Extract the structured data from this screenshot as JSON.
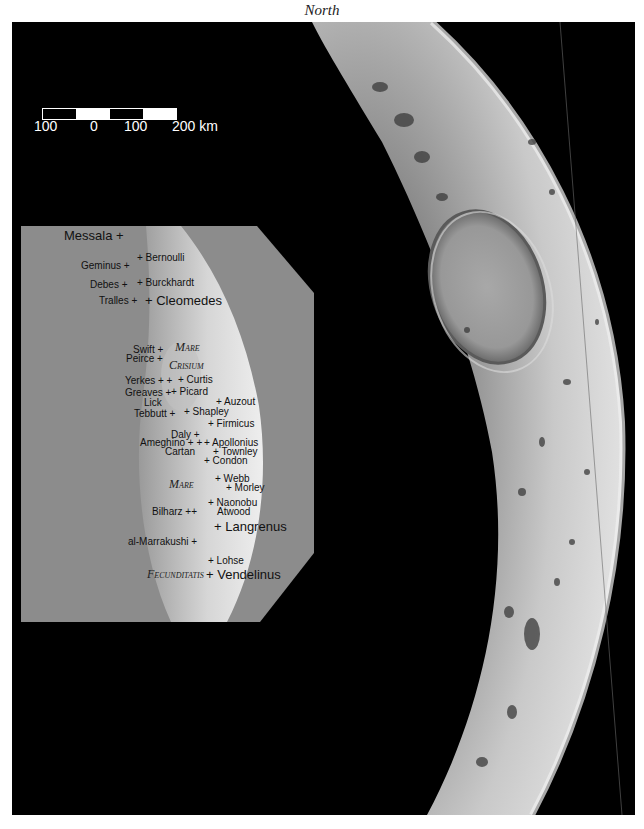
{
  "title": "North",
  "corner_text": "",
  "scale_bar": {
    "labels": [
      "100",
      "0",
      "100",
      "200 km"
    ],
    "segments": [
      "black",
      "white",
      "black",
      "white"
    ]
  },
  "inset": {
    "maria": [
      {
        "id": "mare-crisium-1",
        "text": "Mare"
      },
      {
        "id": "mare-crisium-2",
        "text": "Crisium"
      },
      {
        "id": "mare-fecunditatis-1",
        "text": "Mare"
      },
      {
        "id": "mare-fecunditatis-2",
        "text": "Fecunditatis"
      }
    ],
    "craters": [
      {
        "id": "messala",
        "text": "Messala +"
      },
      {
        "id": "bernoulli",
        "text": "+ Bernoulli"
      },
      {
        "id": "geminus",
        "text": "Geminus +"
      },
      {
        "id": "debes",
        "text": "Debes +"
      },
      {
        "id": "burckhardt",
        "text": "+ Burckhardt"
      },
      {
        "id": "tralles",
        "text": "Tralles +"
      },
      {
        "id": "cleomedes",
        "text": "+ Cleomedes"
      },
      {
        "id": "swift",
        "text": "Swift +"
      },
      {
        "id": "peirce",
        "text": "Peirce +"
      },
      {
        "id": "yerkes",
        "text": "Yerkes + +"
      },
      {
        "id": "curtis",
        "text": "+ Curtis"
      },
      {
        "id": "greaves",
        "text": "Greaves +"
      },
      {
        "id": "picard",
        "text": "+ Picard"
      },
      {
        "id": "lick",
        "text": "Lick"
      },
      {
        "id": "auzout",
        "text": "+ Auzout"
      },
      {
        "id": "tebbutt",
        "text": "Tebbutt +"
      },
      {
        "id": "shapley",
        "text": "+ Shapley"
      },
      {
        "id": "firmicus",
        "text": "+ Firmicus"
      },
      {
        "id": "daly",
        "text": "Daly +"
      },
      {
        "id": "ameghino",
        "text": "Ameghino + +"
      },
      {
        "id": "apollonius",
        "text": "+ Apollonius"
      },
      {
        "id": "cartan",
        "text": "Cartan"
      },
      {
        "id": "townley",
        "text": "+ Townley"
      },
      {
        "id": "condon",
        "text": "+ Condon"
      },
      {
        "id": "webb",
        "text": "+ Webb"
      },
      {
        "id": "morley",
        "text": "+ Morley"
      },
      {
        "id": "naonobu",
        "text": "+ Naonobu"
      },
      {
        "id": "bilharz",
        "text": "Bilharz ++"
      },
      {
        "id": "atwood",
        "text": "Atwood"
      },
      {
        "id": "langrenus",
        "text": "+ Langrenus"
      },
      {
        "id": "al-marrakushi",
        "text": "al-Marrakushi +"
      },
      {
        "id": "lohse",
        "text": "+ Lohse"
      },
      {
        "id": "vendelinus",
        "text": "+ Vendelinus"
      }
    ]
  },
  "colors": {
    "background": "#ffffff",
    "sky": "#000000",
    "inset_background": "#8c8c8c",
    "moon_surface": "#c8c8c8",
    "label_text": "#111111",
    "scale_text": "#ffffff"
  }
}
